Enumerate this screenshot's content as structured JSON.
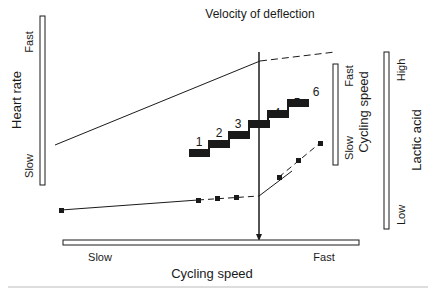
{
  "diagram": {
    "title": "Velocity of deflection",
    "colors": {
      "ink": "#1a1a1a",
      "bar_fill": "#ffffff",
      "divider": "#bbbbbb"
    },
    "heart_rate_axis": {
      "label": "Heart rate",
      "high": "Fast",
      "low": "Slow"
    },
    "cycling_speed_right_axis": {
      "label": "Cycling speed",
      "high": "Fast",
      "low": "Slow"
    },
    "lactic_acid_axis": {
      "label": "Lactic acid",
      "high": "High",
      "low": "Low"
    },
    "x_axis": {
      "label": "Cycling speed",
      "left": "Slow",
      "right": "Fast"
    },
    "steps": [
      {
        "label": "1"
      },
      {
        "label": "2"
      },
      {
        "label": "3"
      },
      {
        "label": "4"
      },
      {
        "label": "5"
      },
      {
        "label": "6"
      }
    ]
  }
}
